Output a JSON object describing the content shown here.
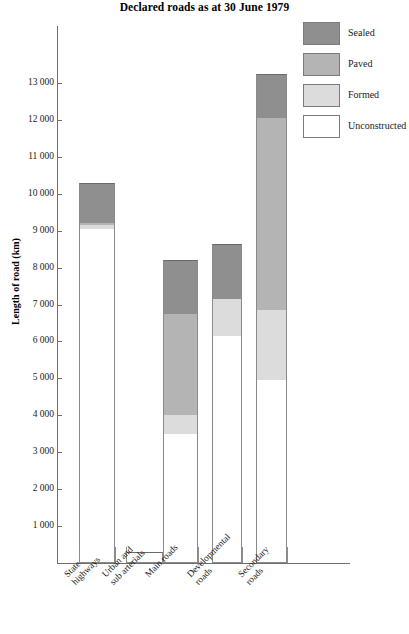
{
  "chart_data": {
    "type": "bar",
    "subtype": "stacked-vertical",
    "title": "Declared roads as at 30 June 1979",
    "xlabel": "",
    "ylabel": "Length of road (km)",
    "ylim": [
      0,
      13500
    ],
    "ytick_step": 1000,
    "grid": false,
    "legend_position": "top-right",
    "categories": [
      "State highways",
      "Urban and sub arterials",
      "Main roads",
      "Developmental roads",
      "Secondary roads"
    ],
    "category_lines": [
      [
        "State",
        "highways"
      ],
      [
        "Urban and",
        "sub arterials"
      ],
      [
        "Main roads"
      ],
      [
        "Developmental",
        "roads"
      ],
      [
        "Secondary",
        "roads"
      ]
    ],
    "ytick_labels": [
      "13 000",
      "12 000",
      "11 000",
      "10 000",
      "9 000",
      "8 000",
      "7 000",
      "6 000",
      "5 000",
      "4 000",
      "3 000",
      "2 000",
      "1 000"
    ],
    "ytick_values": [
      13000,
      12000,
      11000,
      10000,
      9000,
      8000,
      7000,
      6000,
      5000,
      4000,
      3000,
      2000,
      1000
    ],
    "series": [
      {
        "name": "Sealed",
        "color": "#8f8f8f",
        "values": [
          1100,
          0,
          1450,
          1500,
          1200
        ]
      },
      {
        "name": "Paved",
        "color": "#b4b4b4",
        "values": [
          50,
          0,
          2750,
          0,
          5200
        ]
      },
      {
        "name": "Formed",
        "color": "#dcdcdc",
        "values": [
          100,
          0,
          500,
          1000,
          1900
        ]
      },
      {
        "name": "Unconstructed",
        "color": "#ffffff",
        "values": [
          9050,
          300,
          3500,
          6150,
          4950
        ]
      }
    ],
    "totals": [
      10300,
      300,
      8200,
      8650,
      13250
    ],
    "stack_boundaries": [
      {
        "category": "State highways",
        "unconstructed_top": 9150,
        "formed_top": 9250,
        "paved_top": 9200,
        "sealed_top": 10300
      },
      {
        "category": "Urban and sub arterials",
        "unconstructed_top": 300,
        "formed_top": 300,
        "paved_top": 300,
        "sealed_top": 300
      },
      {
        "category": "Main roads",
        "unconstructed_top": 3500,
        "formed_top": 4000,
        "paved_top": 6750,
        "sealed_top": 8200
      },
      {
        "category": "Developmental roads",
        "unconstructed_top": 6150,
        "formed_top": 7150,
        "paved_top": 7150,
        "sealed_top": 8650
      },
      {
        "category": "Secondary roads",
        "unconstructed_top": 4950,
        "formed_top": 6850,
        "paved_top": 12050,
        "sealed_top": 13250
      }
    ]
  },
  "legend": {
    "items": [
      {
        "label": "Sealed",
        "color": "#8f8f8f"
      },
      {
        "label": "Paved",
        "color": "#b4b4b4"
      },
      {
        "label": "Formed",
        "color": "#dcdcdc"
      },
      {
        "label": "Unconstructed",
        "color": "#ffffff"
      }
    ]
  },
  "axis": {
    "y_title": "Length of road (km)"
  }
}
